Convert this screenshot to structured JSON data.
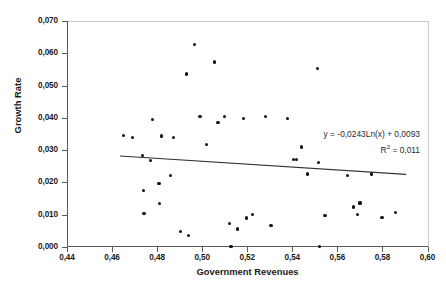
{
  "chart_data": {
    "type": "scatter",
    "title": "",
    "xlabel": "Government Revenues",
    "ylabel": "Growth Rate",
    "xlim": [
      0.44,
      0.6
    ],
    "ylim": [
      0.0,
      0.07
    ],
    "xticks": [
      "0,44",
      "0,46",
      "0,48",
      "0,50",
      "0,52",
      "0,54",
      "0,56",
      "0,58",
      "0,60"
    ],
    "yticks": [
      "0,000",
      "0,010",
      "0,020",
      "0,030",
      "0,040",
      "0,050",
      "0,060",
      "0,070"
    ],
    "grid": false,
    "legend": null,
    "decimal_separator": ",",
    "marker_color": "#111111",
    "trendline_color": "#333333",
    "annotation_equation": "y = -0,0243Ln(x) + 0,0093",
    "annotation_r2": "R2 = 0,011",
    "annotation_r2_prefix": "R",
    "annotation_r2_sup": "2",
    "annotation_r2_suffix": " = 0,011",
    "trendline": {
      "type": "logarithmic",
      "slope_coefficient": -0.0243,
      "intercept": 0.0093,
      "r_squared": 0.011,
      "x_start": 0.4635,
      "y_start": 0.0282,
      "x_end": 0.5905,
      "y_end": 0.0225
    },
    "points": [
      {
        "x": 0.465,
        "y": 0.0346
      },
      {
        "x": 0.469,
        "y": 0.0338
      },
      {
        "x": 0.4735,
        "y": 0.0283
      },
      {
        "x": 0.4738,
        "y": 0.0174
      },
      {
        "x": 0.4742,
        "y": 0.0104
      },
      {
        "x": 0.477,
        "y": 0.0268
      },
      {
        "x": 0.4778,
        "y": 0.0396
      },
      {
        "x": 0.4808,
        "y": 0.0197
      },
      {
        "x": 0.4812,
        "y": 0.0134
      },
      {
        "x": 0.4858,
        "y": 0.0222
      },
      {
        "x": 0.4905,
        "y": 0.0048
      },
      {
        "x": 0.493,
        "y": 0.0536
      },
      {
        "x": 0.4938,
        "y": 0.0036
      },
      {
        "x": 0.4965,
        "y": 0.0628
      },
      {
        "x": 0.499,
        "y": 0.0404
      },
      {
        "x": 0.5055,
        "y": 0.0573
      },
      {
        "x": 0.507,
        "y": 0.0386
      },
      {
        "x": 0.5098,
        "y": 0.0404
      },
      {
        "x": 0.512,
        "y": 0.0074
      },
      {
        "x": 0.5128,
        "y": 0.0002
      },
      {
        "x": 0.5155,
        "y": 0.0056
      },
      {
        "x": 0.5185,
        "y": 0.0398
      },
      {
        "x": 0.5195,
        "y": 0.009
      },
      {
        "x": 0.5222,
        "y": 0.01
      },
      {
        "x": 0.5305,
        "y": 0.0066
      },
      {
        "x": 0.538,
        "y": 0.0397
      },
      {
        "x": 0.5405,
        "y": 0.0272
      },
      {
        "x": 0.5418,
        "y": 0.0272
      },
      {
        "x": 0.544,
        "y": 0.031
      },
      {
        "x": 0.5468,
        "y": 0.0226
      },
      {
        "x": 0.551,
        "y": 0.0552
      },
      {
        "x": 0.5518,
        "y": 0.0262
      },
      {
        "x": 0.552,
        "y": 0.0002
      },
      {
        "x": 0.5545,
        "y": 0.0098
      },
      {
        "x": 0.5645,
        "y": 0.0222
      },
      {
        "x": 0.5672,
        "y": 0.0124
      },
      {
        "x": 0.569,
        "y": 0.01
      },
      {
        "x": 0.57,
        "y": 0.0136
      },
      {
        "x": 0.5752,
        "y": 0.0226
      },
      {
        "x": 0.5798,
        "y": 0.0092
      },
      {
        "x": 0.5858,
        "y": 0.0106
      },
      {
        "x": 0.482,
        "y": 0.0344
      },
      {
        "x": 0.4872,
        "y": 0.0338
      },
      {
        "x": 0.5018,
        "y": 0.0318
      },
      {
        "x": 0.5282,
        "y": 0.0404
      }
    ]
  }
}
